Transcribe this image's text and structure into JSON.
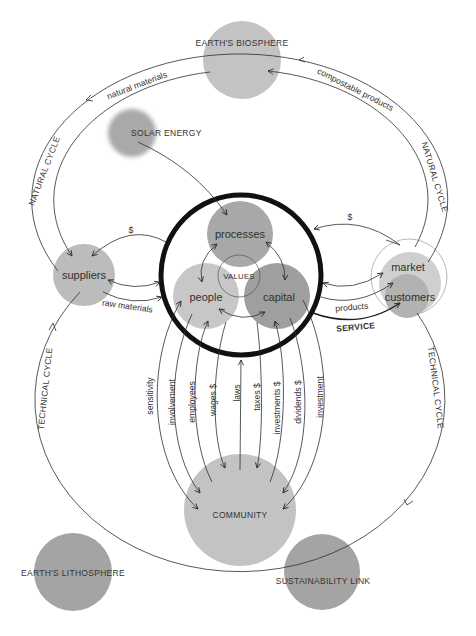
{
  "nodes": {
    "biosphere": "EARTH'S BIOSPHERE",
    "solar": "SOLAR ENERGY",
    "suppliers": "suppliers",
    "processes": "processes",
    "people": "people",
    "capital": "capital",
    "values": "VALUES",
    "market": "market",
    "customers": "customers",
    "community": "COMMUNITY",
    "lithosphere": "EARTH'S LITHOSPHERE",
    "sustainability": "SUSTAINABILITY LINK"
  },
  "cycles": {
    "natural_left": "NATURAL CYCLE",
    "natural_right": "NATURAL CYCLE",
    "technical_left": "TECHNICAL CYCLE",
    "technical_right": "TECHNICAL CYCLE"
  },
  "flows": {
    "natural_materials": "natural materials",
    "compostable_products": "compostable products",
    "supplier_money": "$",
    "raw_materials": "raw materials",
    "market_money": "$",
    "products": "products",
    "service": "SERVICE"
  },
  "community_flows": [
    "sensitivity",
    "involvement",
    "employees",
    "wages $",
    "laws",
    "taxes $",
    "investments $",
    "dividends $",
    "investment"
  ],
  "colors": {
    "background": "#ffffff",
    "text": "#333333",
    "line": "#2e2e2e",
    "core_ring": "#111111",
    "biosphere": "#c3c3c3",
    "solar": "#a9a9a9",
    "suppliers": "#bcbcbc",
    "processes": "#a8a8a8",
    "people": "#c7c7c7",
    "capital": "#9f9f9f",
    "market": "#cfcfcf",
    "customers": "#b2b2b2",
    "community": "#c3c3c3",
    "lithosphere": "#a4a4a4",
    "sustainability": "#a4a4a4"
  }
}
